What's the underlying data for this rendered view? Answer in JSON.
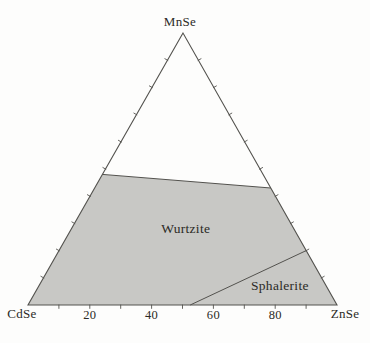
{
  "figure": {
    "background_color": "#fdfdfc"
  },
  "chart_data": {
    "type": "ternary-phase-diagram",
    "vertices": {
      "top": {
        "label": "MnSe"
      },
      "bottom_left": {
        "label": "CdSe"
      },
      "bottom_right": {
        "label": "ZnSe"
      }
    },
    "axis": {
      "range": [
        0,
        100
      ],
      "minor_tick_step_percent": 10,
      "bottom_tick_labels": [
        20,
        40,
        60,
        80
      ],
      "ticks_on_edges": [
        "bottom",
        "left",
        "right"
      ]
    },
    "shaded_region": {
      "fill": "#c8c8c5",
      "vertices_ternary": [
        {
          "cdse": 100,
          "znse": 0,
          "mnse": 0
        },
        {
          "cdse": 52,
          "znse": 0,
          "mnse": 48
        },
        {
          "cdse": 0,
          "znse": 57,
          "mnse": 43
        },
        {
          "cdse": 0,
          "znse": 100,
          "mnse": 0
        }
      ]
    },
    "phase_boundaries": [
      {
        "name": "wurtzite-upper-solubility-limit",
        "from": {
          "cdse": 52,
          "znse": 0,
          "mnse": 48
        },
        "to": {
          "cdse": 0,
          "znse": 57,
          "mnse": 43
        }
      },
      {
        "name": "wurtzite-sphalerite-boundary",
        "from": {
          "cdse": 47.5,
          "znse": 52.5,
          "mnse": 0
        },
        "to": {
          "cdse": 0,
          "znse": 80,
          "mnse": 20
        }
      }
    ],
    "region_labels": [
      {
        "text": "Wurtzite",
        "ternary": {
          "cdse": 35,
          "znse": 37,
          "mnse": 28
        }
      },
      {
        "text": "Sphalerite",
        "ternary": {
          "cdse": 15,
          "znse": 78,
          "mnse": 7
        }
      }
    ],
    "colors": {
      "line": "#53524e",
      "text": "#2b2a26",
      "fill": "#c8c8c5"
    }
  }
}
